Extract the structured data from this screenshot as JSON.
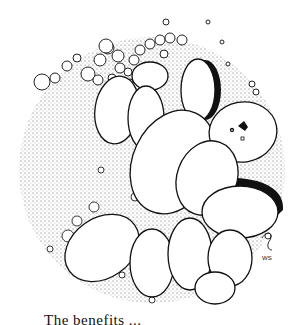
{
  "illustration": {
    "subject": "stippled pen-and-ink drawing of oval cells in a circular microscope field",
    "signature": "WS",
    "colors": {
      "ink": "#111111",
      "paper": "#ffffff",
      "stipple": "#555555"
    }
  },
  "caption": {
    "text": "The benefits ...",
    "note_visible": "partially cut off at bottom edge"
  }
}
